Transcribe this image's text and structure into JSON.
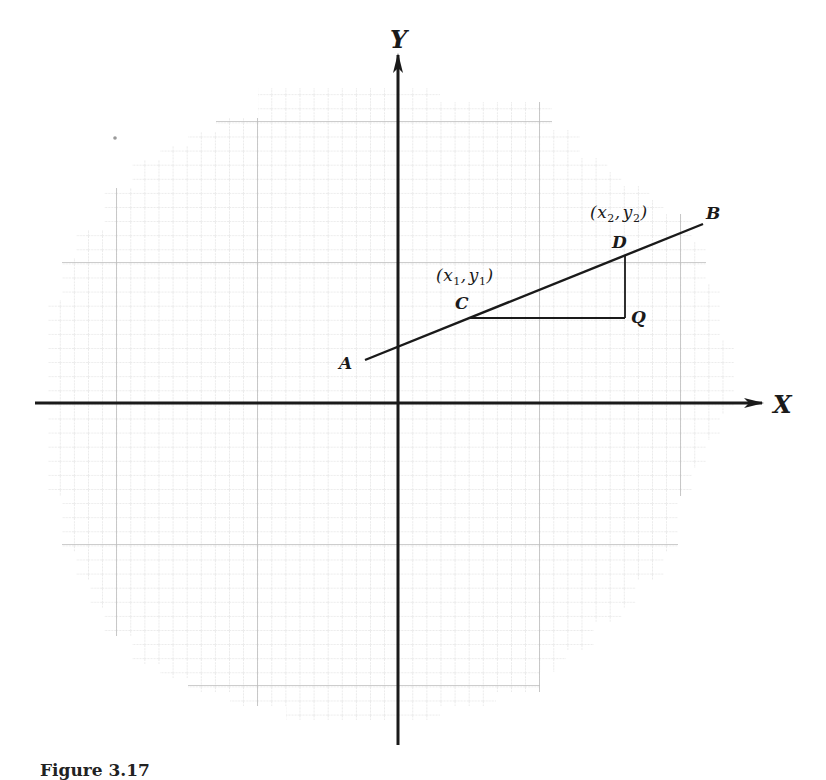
{
  "figure": {
    "caption": "Figure 3.17",
    "axes": {
      "x_label": "X",
      "y_label": "Y",
      "origin_px": [
        398,
        403
      ]
    },
    "grid": {
      "cell_px": 14.1,
      "major_every": 10,
      "minor_color": "#d4d4d4",
      "major_color": "#b8b8b8",
      "shape": "circular-clipped graph paper"
    },
    "line_AB": {
      "label_start": "A",
      "label_end": "B",
      "start_px": [
        365,
        360
      ],
      "end_px": [
        703,
        224
      ]
    },
    "points": {
      "C": {
        "label": "C",
        "coord_label_var": "x",
        "coord_label_var2": "y",
        "sub": "1",
        "px": [
          470,
          318
        ]
      },
      "D": {
        "label": "D",
        "coord_label_var": "x",
        "coord_label_var2": "y",
        "sub": "2",
        "px": [
          625,
          256
        ]
      },
      "Q": {
        "label": "Q",
        "px": [
          625,
          318
        ]
      }
    },
    "colors": {
      "ink": "#1a1a1a",
      "background": "#ffffff"
    }
  }
}
